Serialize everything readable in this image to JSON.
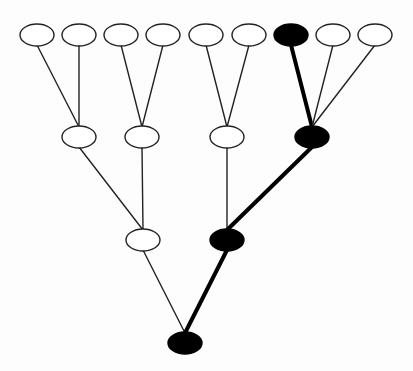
{
  "diagram": {
    "type": "tree",
    "colors": {
      "background": "#fdfdfd",
      "node_fill": "#ffffff",
      "node_stroke": "#222222",
      "highlight_fill": "#000000",
      "edge": "#222222",
      "highlight_edge": "#000000"
    },
    "node_size": {
      "rx": 17,
      "ry": 11
    },
    "nodes": [
      {
        "id": "L1",
        "x": 37,
        "y": 35,
        "highlighted": false
      },
      {
        "id": "L2",
        "x": 79,
        "y": 35,
        "highlighted": false
      },
      {
        "id": "L3",
        "x": 121,
        "y": 35,
        "highlighted": false
      },
      {
        "id": "L4",
        "x": 163,
        "y": 35,
        "highlighted": false
      },
      {
        "id": "L5",
        "x": 206,
        "y": 35,
        "highlighted": false
      },
      {
        "id": "L6",
        "x": 249,
        "y": 35,
        "highlighted": false
      },
      {
        "id": "L7",
        "x": 291,
        "y": 35,
        "highlighted": true
      },
      {
        "id": "L8",
        "x": 333,
        "y": 35,
        "highlighted": false
      },
      {
        "id": "L9",
        "x": 375,
        "y": 35,
        "highlighted": false
      },
      {
        "id": "M1",
        "x": 79,
        "y": 137,
        "highlighted": false
      },
      {
        "id": "M2",
        "x": 142,
        "y": 137,
        "highlighted": false
      },
      {
        "id": "M3",
        "x": 227,
        "y": 137,
        "highlighted": false
      },
      {
        "id": "M4",
        "x": 312,
        "y": 137,
        "highlighted": true
      },
      {
        "id": "N1",
        "x": 143,
        "y": 240,
        "highlighted": false
      },
      {
        "id": "N2",
        "x": 227,
        "y": 240,
        "highlighted": true
      },
      {
        "id": "R",
        "x": 185,
        "y": 343,
        "highlighted": true
      }
    ],
    "edges": [
      {
        "from": "L1",
        "to": "M1",
        "highlighted": false
      },
      {
        "from": "L2",
        "to": "M1",
        "highlighted": false
      },
      {
        "from": "L3",
        "to": "M2",
        "highlighted": false
      },
      {
        "from": "L4",
        "to": "M2",
        "highlighted": false
      },
      {
        "from": "L5",
        "to": "M3",
        "highlighted": false
      },
      {
        "from": "L6",
        "to": "M3",
        "highlighted": false
      },
      {
        "from": "L7",
        "to": "M4",
        "highlighted": true
      },
      {
        "from": "L8",
        "to": "M4",
        "highlighted": false
      },
      {
        "from": "L9",
        "to": "M4",
        "highlighted": false
      },
      {
        "from": "M1",
        "to": "N1",
        "highlighted": false
      },
      {
        "from": "M2",
        "to": "N1",
        "highlighted": false
      },
      {
        "from": "M3",
        "to": "N2",
        "highlighted": false
      },
      {
        "from": "M4",
        "to": "N2",
        "highlighted": true
      },
      {
        "from": "N1",
        "to": "R",
        "highlighted": false
      },
      {
        "from": "N2",
        "to": "R",
        "highlighted": true
      }
    ]
  }
}
